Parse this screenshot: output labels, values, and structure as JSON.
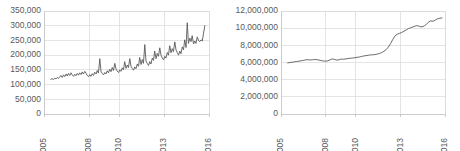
{
  "figure": {
    "panel_count": 2,
    "background_color": "#ffffff",
    "line_color": "#595959",
    "grid_color": "#d9d9d9",
    "axis_color": "#bfbfbf"
  },
  "chart_data": [
    {
      "type": "line",
      "title": "",
      "xlabel": "",
      "ylabel": "",
      "grid": true,
      "legend": "none",
      "line_color": "#595959",
      "xlim": [
        2005,
        2016
      ],
      "ylim": [
        0,
        350000
      ],
      "ytick_labels": [
        "0",
        "50,000",
        "100,000",
        "150,000",
        "200,000",
        "250,000",
        "300,000",
        "350,000"
      ],
      "ytick_values": [
        0,
        50000,
        100000,
        150000,
        200000,
        250000,
        300000,
        350000
      ],
      "xtick_labels": [
        "2005",
        "2008",
        "2010",
        "2013",
        "2016"
      ],
      "xtick_values": [
        2005,
        2008,
        2010,
        2013,
        2016
      ],
      "x": [
        2005.45,
        2005.54,
        2005.63,
        2005.71,
        2005.8,
        2005.88,
        2005.97,
        2006.05,
        2006.13,
        2006.22,
        2006.3,
        2006.38,
        2006.47,
        2006.55,
        2006.63,
        2006.72,
        2006.8,
        2006.88,
        2006.97,
        2007.05,
        2007.13,
        2007.22,
        2007.3,
        2007.38,
        2007.47,
        2007.55,
        2007.63,
        2007.72,
        2007.8,
        2007.88,
        2007.97,
        2008.05,
        2008.13,
        2008.22,
        2008.3,
        2008.38,
        2008.47,
        2008.55,
        2008.63,
        2008.72,
        2008.8,
        2008.88,
        2008.97,
        2009.05,
        2009.13,
        2009.22,
        2009.3,
        2009.38,
        2009.47,
        2009.55,
        2009.63,
        2009.72,
        2009.8,
        2009.88,
        2009.97,
        2010.05,
        2010.13,
        2010.22,
        2010.3,
        2010.38,
        2010.47,
        2010.55,
        2010.63,
        2010.72,
        2010.8,
        2010.88,
        2010.97,
        2011.05,
        2011.13,
        2011.22,
        2011.3,
        2011.38,
        2011.47,
        2011.55,
        2011.63,
        2011.72,
        2011.8,
        2011.88,
        2011.97,
        2012.05,
        2012.13,
        2012.22,
        2012.3,
        2012.38,
        2012.47,
        2012.55,
        2012.63,
        2012.72,
        2012.8,
        2012.88,
        2012.97,
        2013.05,
        2013.13,
        2013.22,
        2013.3,
        2013.38,
        2013.47,
        2013.55,
        2013.63,
        2013.72,
        2013.8,
        2013.88,
        2013.97,
        2014.05,
        2014.13,
        2014.22,
        2014.3,
        2014.38,
        2014.47,
        2014.55,
        2014.63,
        2014.72,
        2014.8,
        2014.88,
        2014.97,
        2015.05,
        2015.13,
        2015.22,
        2015.3,
        2015.38,
        2015.47,
        2015.55,
        2015.63,
        2015.72
      ],
      "values": [
        118000,
        120000,
        117000,
        122000,
        119000,
        124000,
        121000,
        126000,
        131000,
        124000,
        133000,
        127000,
        136000,
        129000,
        138000,
        131000,
        140000,
        133000,
        128000,
        135000,
        130000,
        138000,
        132000,
        140000,
        134000,
        143000,
        136000,
        145000,
        139000,
        131000,
        127000,
        134000,
        128000,
        137000,
        131000,
        142000,
        136000,
        148000,
        139000,
        188000,
        145000,
        138000,
        133000,
        141000,
        136000,
        147000,
        140000,
        152000,
        144000,
        158000,
        148000,
        172000,
        153000,
        146000,
        141000,
        150000,
        145000,
        157000,
        150000,
        178000,
        155000,
        166000,
        158000,
        188000,
        162000,
        155000,
        149000,
        160000,
        154000,
        170000,
        162000,
        192000,
        168000,
        185000,
        172000,
        236000,
        180000,
        172000,
        165000,
        178000,
        170000,
        190000,
        182000,
        214000,
        188000,
        206000,
        196000,
        225000,
        200000,
        191000,
        184000,
        196000,
        190000,
        209000,
        200000,
        232000,
        208000,
        222000,
        212000,
        245000,
        218000,
        209000,
        200000,
        214000,
        205000,
        228000,
        218000,
        252000,
        226000,
        310000,
        240000,
        258000,
        246000,
        266000,
        238000,
        248000,
        240000,
        262000,
        250000,
        246000,
        252000,
        248000,
        272000,
        300000
      ]
    },
    {
      "type": "line",
      "title": "",
      "xlabel": "",
      "ylabel": "",
      "grid": true,
      "legend": "none",
      "line_color": "#595959",
      "xlim": [
        2005,
        2016
      ],
      "ylim": [
        0,
        12000000
      ],
      "ytick_labels": [
        "0",
        "2,000,000",
        "4,000,000",
        "6,000,000",
        "8,000,000",
        "10,000,000",
        "12,000,000"
      ],
      "ytick_values": [
        0,
        2000000,
        4000000,
        6000000,
        8000000,
        10000000,
        12000000
      ],
      "xtick_labels": [
        "2005",
        "2008",
        "2010",
        "2013",
        "2016"
      ],
      "xtick_values": [
        2005,
        2008,
        2010,
        2013,
        2016
      ],
      "x": [
        2005.45,
        2005.6,
        2005.75,
        2005.9,
        2006.05,
        2006.2,
        2006.35,
        2006.5,
        2006.65,
        2006.8,
        2006.95,
        2007.1,
        2007.25,
        2007.4,
        2007.55,
        2007.7,
        2007.85,
        2008.0,
        2008.15,
        2008.3,
        2008.45,
        2008.6,
        2008.75,
        2008.9,
        2009.05,
        2009.2,
        2009.35,
        2009.5,
        2009.65,
        2009.8,
        2009.95,
        2010.1,
        2010.25,
        2010.4,
        2010.55,
        2010.7,
        2010.85,
        2011.0,
        2011.15,
        2011.3,
        2011.45,
        2011.6,
        2011.75,
        2011.9,
        2012.05,
        2012.2,
        2012.35,
        2012.5,
        2012.65,
        2012.8,
        2012.95,
        2013.1,
        2013.25,
        2013.4,
        2013.55,
        2013.7,
        2013.85,
        2014.0,
        2014.15,
        2014.3,
        2014.45,
        2014.6,
        2014.75,
        2014.9,
        2015.05,
        2015.2,
        2015.35,
        2015.5,
        2015.65,
        2015.8
      ],
      "values": [
        5950000,
        6000000,
        6030000,
        6080000,
        6120000,
        6150000,
        6200000,
        6250000,
        6300000,
        6330000,
        6290000,
        6310000,
        6360000,
        6330000,
        6280000,
        6220000,
        6180000,
        6150000,
        6200000,
        6320000,
        6420000,
        6350000,
        6280000,
        6320000,
        6400000,
        6380000,
        6420000,
        6460000,
        6500000,
        6520000,
        6560000,
        6600000,
        6640000,
        6700000,
        6760000,
        6800000,
        6840000,
        6880000,
        6900000,
        6920000,
        6980000,
        7050000,
        7150000,
        7300000,
        7500000,
        7800000,
        8200000,
        8700000,
        9100000,
        9300000,
        9400000,
        9500000,
        9650000,
        9800000,
        9950000,
        10050000,
        10150000,
        10250000,
        10300000,
        10200000,
        10150000,
        10250000,
        10450000,
        10700000,
        10850000,
        10800000,
        10950000,
        11100000,
        11150000,
        11200000
      ]
    }
  ]
}
